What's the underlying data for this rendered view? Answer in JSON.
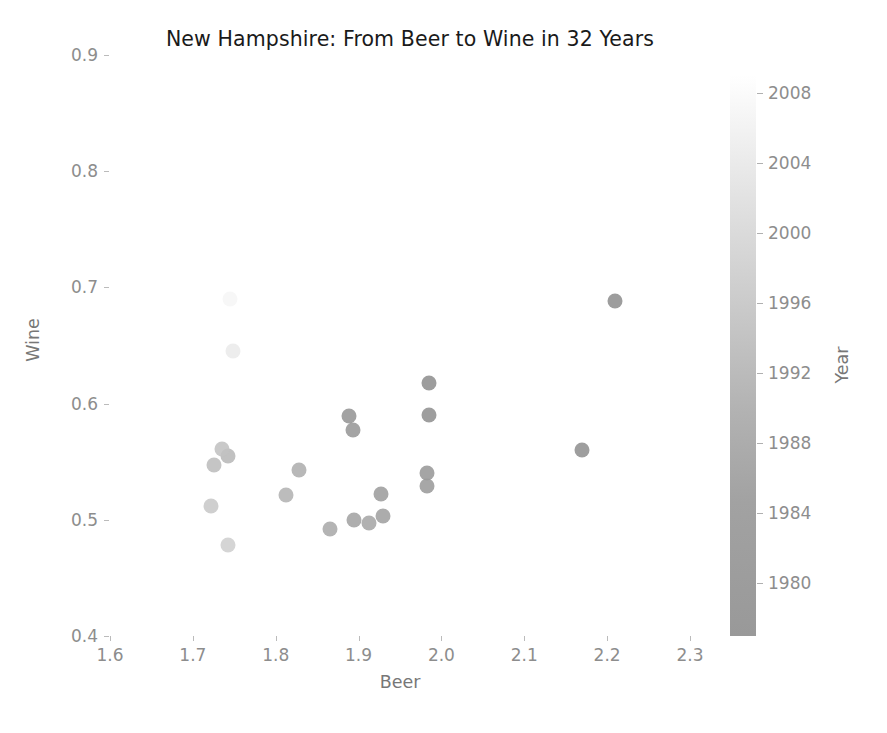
{
  "chart_data": {
    "type": "scatter",
    "title": "New Hampshire: From Beer to Wine in 32 Years",
    "xlabel": "Beer",
    "ylabel": "Wine",
    "xlim": [
      1.6,
      2.3
    ],
    "ylim": [
      0.4,
      0.9
    ],
    "xticks": [
      "1.6",
      "1.7",
      "1.8",
      "1.9",
      "2.0",
      "2.1",
      "2.2",
      "2.3"
    ],
    "xtick_values": [
      1.6,
      1.7,
      1.8,
      1.9,
      2.0,
      2.1,
      2.2,
      2.3
    ],
    "yticks": [
      "0.4",
      "0.5",
      "0.6",
      "0.7",
      "0.8",
      "0.9"
    ],
    "ytick_values": [
      0.4,
      0.5,
      0.6,
      0.7,
      0.8,
      0.9
    ],
    "grid": false,
    "legend": "none",
    "colorbar": {
      "label": "Year",
      "position": "right",
      "vmin": 1977,
      "vmax": 2009,
      "ticks": [
        "1980",
        "1984",
        "1988",
        "1992",
        "1996",
        "2000",
        "2004",
        "2008"
      ],
      "tick_values": [
        1980,
        1984,
        1988,
        1992,
        1996,
        2000,
        2004,
        2008
      ],
      "colormap": "gray_r_dark_to_light",
      "color_low": "#999999",
      "color_high": "#ffffff"
    },
    "color_series": "Year",
    "marker": "circle",
    "marker_size": 15,
    "points": [
      {
        "beer": 2.21,
        "wine": 0.688,
        "year": 1977,
        "color": "#8f8f8f"
      },
      {
        "beer": 2.17,
        "wine": 0.56,
        "year": 1978,
        "color": "#919191"
      },
      {
        "beer": 1.985,
        "wine": 0.618,
        "year": 1979,
        "color": "#8f8f8f"
      },
      {
        "beer": 1.985,
        "wine": 0.59,
        "year": 1980,
        "color": "#919191"
      },
      {
        "beer": 1.888,
        "wine": 0.589,
        "year": 1981,
        "color": "#959595"
      },
      {
        "beer": 1.893,
        "wine": 0.577,
        "year": 1982,
        "color": "#979797"
      },
      {
        "beer": 1.982,
        "wine": 0.54,
        "year": 1983,
        "color": "#999999"
      },
      {
        "beer": 1.983,
        "wine": 0.529,
        "year": 1984,
        "color": "#9b9b9b"
      },
      {
        "beer": 1.927,
        "wine": 0.522,
        "year": 1985,
        "color": "#9d9d9d"
      },
      {
        "beer": 1.93,
        "wine": 0.503,
        "year": 1986,
        "color": "#a0a0a0"
      },
      {
        "beer": 1.894,
        "wine": 0.5,
        "year": 1987,
        "color": "#a3a3a3"
      },
      {
        "beer": 1.912,
        "wine": 0.497,
        "year": 1988,
        "color": "#a6a6a6"
      },
      {
        "beer": 1.866,
        "wine": 0.492,
        "year": 1989,
        "color": "#aaaaaa"
      },
      {
        "beer": 1.828,
        "wine": 0.543,
        "year": 1990,
        "color": "#aeaeae"
      },
      {
        "beer": 1.812,
        "wine": 0.521,
        "year": 1991,
        "color": "#b3b3b3"
      },
      {
        "beer": 1.742,
        "wine": 0.555,
        "year": 1992,
        "color": "#b8b8b8"
      },
      {
        "beer": 1.725,
        "wine": 0.547,
        "year": 1993,
        "color": "#bdbdbd"
      },
      {
        "beer": 1.735,
        "wine": 0.561,
        "year": 1994,
        "color": "#c2c2c2"
      },
      {
        "beer": 1.722,
        "wine": 0.512,
        "year": 1995,
        "color": "#c8c8c8"
      },
      {
        "beer": 1.742,
        "wine": 0.478,
        "year": 1996,
        "color": "#cfcfcf"
      },
      {
        "beer": 1.748,
        "wine": 0.645,
        "year": 2004,
        "color": "#ebebeb"
      },
      {
        "beer": 1.745,
        "wine": 0.69,
        "year": 2008,
        "color": "#f6f6f6"
      }
    ]
  },
  "figure": {
    "background": "#ffffff",
    "text_color": "#8d8d8d",
    "title_color": "#1a1a1a"
  }
}
